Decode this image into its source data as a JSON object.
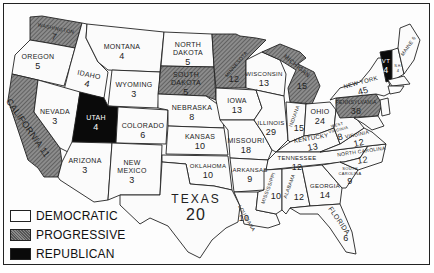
{
  "map": {
    "title": "",
    "legend": [
      {
        "key": "democratic",
        "label": "DEMOCRATIC",
        "fill": "#ffffff"
      },
      {
        "key": "progressive",
        "label": "PROGRESSIVE",
        "fill": "#7a7a7a"
      },
      {
        "key": "republican",
        "label": "REPUBLICAN",
        "fill": "#0a0a0a"
      }
    ],
    "states": [
      {
        "name": "WASHINGTON",
        "votes": "7",
        "party": "progressive"
      },
      {
        "name": "OREGON",
        "votes": "5",
        "party": "democratic"
      },
      {
        "name": "CALIFORNIA",
        "votes": "11",
        "party": "progressive"
      },
      {
        "name": "IDAHO",
        "votes": "4",
        "party": "democratic"
      },
      {
        "name": "NEVADA",
        "votes": "3",
        "party": "democratic"
      },
      {
        "name": "MONTANA",
        "votes": "4",
        "party": "democratic"
      },
      {
        "name": "WYOMING",
        "votes": "3",
        "party": "democratic"
      },
      {
        "name": "UTAH",
        "votes": "4",
        "party": "republican"
      },
      {
        "name": "ARIZONA",
        "votes": "3",
        "party": "democratic"
      },
      {
        "name": "COLORADO",
        "votes": "6",
        "party": "democratic"
      },
      {
        "name": "NEW MEXICO",
        "votes": "3",
        "party": "democratic"
      },
      {
        "name": "NORTH DAKOTA",
        "votes": "5",
        "party": "democratic"
      },
      {
        "name": "SOUTH DAKOTA",
        "votes": "5",
        "party": "progressive"
      },
      {
        "name": "NEBRASKA",
        "votes": "8",
        "party": "democratic"
      },
      {
        "name": "KANSAS",
        "votes": "10",
        "party": "democratic"
      },
      {
        "name": "OKLAHOMA",
        "votes": "10",
        "party": "democratic"
      },
      {
        "name": "TEXAS",
        "votes": "20",
        "party": "democratic"
      },
      {
        "name": "MINNESOTA",
        "votes": "12",
        "party": "progressive"
      },
      {
        "name": "IOWA",
        "votes": "13",
        "party": "democratic"
      },
      {
        "name": "MISSOURI",
        "votes": "18",
        "party": "democratic"
      },
      {
        "name": "ARKANSAS",
        "votes": "9",
        "party": "democratic"
      },
      {
        "name": "LOUISIANA",
        "votes": "10",
        "party": "democratic"
      },
      {
        "name": "WISCONSIN",
        "votes": "13",
        "party": "democratic"
      },
      {
        "name": "ILLINOIS",
        "votes": "29",
        "party": "democratic"
      },
      {
        "name": "MICHIGAN",
        "votes": "15",
        "party": "progressive"
      },
      {
        "name": "INDIANA",
        "votes": "15",
        "party": "democratic"
      },
      {
        "name": "OHIO",
        "votes": "24",
        "party": "democratic"
      },
      {
        "name": "KENTUCKY",
        "votes": "13",
        "party": "democratic"
      },
      {
        "name": "TENNESSEE",
        "votes": "12",
        "party": "democratic"
      },
      {
        "name": "MISSISSIPPI",
        "votes": "10",
        "party": "democratic"
      },
      {
        "name": "ALABAMA",
        "votes": "12",
        "party": "democratic"
      },
      {
        "name": "GEORGIA",
        "votes": "14",
        "party": "democratic"
      },
      {
        "name": "FLORIDA",
        "votes": "6",
        "party": "democratic"
      },
      {
        "name": "SOUTH CAROLINA",
        "votes": "9",
        "party": "democratic"
      },
      {
        "name": "NORTH CAROLINA",
        "votes": "12",
        "party": "democratic"
      },
      {
        "name": "VIRGINIA",
        "votes": "12",
        "party": "democratic"
      },
      {
        "name": "WEST VIRGINIA",
        "votes": "8",
        "party": "democratic"
      },
      {
        "name": "PENNSYLVANIA",
        "votes": "38",
        "party": "progressive"
      },
      {
        "name": "NEW YORK",
        "votes": "45",
        "party": "democratic"
      },
      {
        "name": "VT",
        "votes": "4",
        "party": "republican"
      },
      {
        "name": "N.H.",
        "votes": "4",
        "party": "democratic"
      },
      {
        "name": "MAINE",
        "votes": "6",
        "party": "democratic"
      }
    ]
  }
}
